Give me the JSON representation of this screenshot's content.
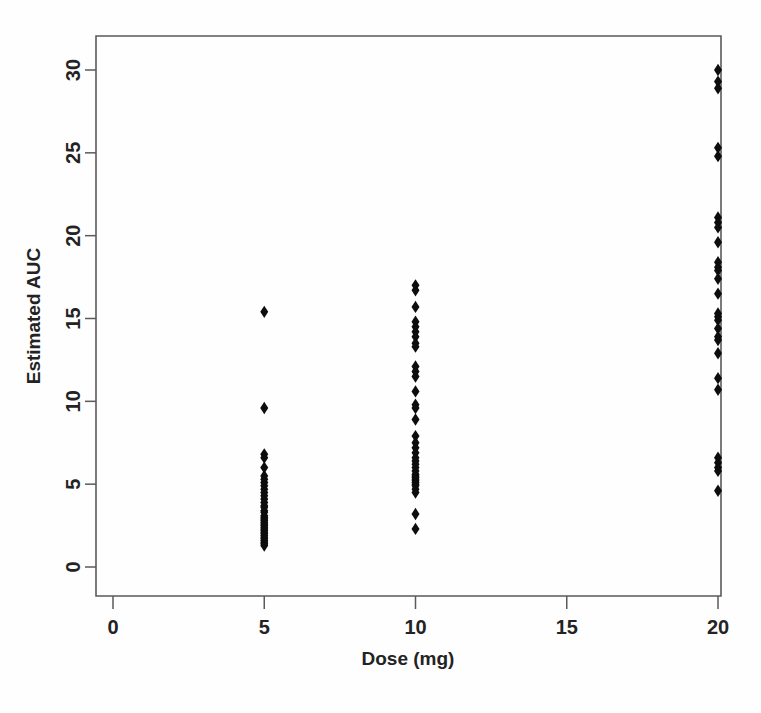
{
  "figure": {
    "title": "",
    "background_color": "#fefefe",
    "frame_color": "#5a5a5a",
    "point_color": "#0d0d0d"
  },
  "axes": {
    "x_title": "Dose (mg)",
    "y_title": "Estimated AUC",
    "x_ticks": [
      "0",
      "5",
      "10",
      "15",
      "20"
    ],
    "y_ticks": [
      "0",
      "5",
      "10",
      "15",
      "20",
      "25",
      "30"
    ]
  },
  "chart_data": {
    "type": "scatter",
    "title": "",
    "xlabel": "Dose (mg)",
    "ylabel": "Estimated AUC",
    "xlim": [
      -1.3,
      21.5
    ],
    "ylim": [
      -1.2,
      32.3
    ],
    "xticks": [
      0,
      5,
      10,
      15,
      20
    ],
    "yticks": [
      0,
      5,
      10,
      15,
      20,
      25,
      30
    ],
    "grid": false,
    "legend": false,
    "marker": "diamond",
    "marker_color": "#0d0d0d",
    "series": [
      {
        "name": "Dose 5 mg",
        "x": 5,
        "values": [
          15.4,
          9.6,
          6.8,
          6.6,
          6.0,
          5.5,
          5.3,
          5.1,
          4.9,
          4.7,
          4.5,
          4.3,
          4.1,
          3.9,
          3.7,
          3.6,
          3.4,
          3.3,
          3.1,
          3.0,
          2.9,
          2.8,
          2.7,
          2.6,
          2.5,
          2.4,
          2.3,
          2.2,
          2.1,
          2.0,
          1.9,
          1.8,
          1.7,
          1.6,
          1.5,
          1.4,
          1.3
        ]
      },
      {
        "name": "Dose 10 mg",
        "x": 10,
        "values": [
          17.0,
          16.7,
          15.7,
          14.8,
          14.5,
          14.2,
          13.9,
          13.5,
          13.3,
          12.1,
          11.8,
          11.5,
          10.6,
          9.8,
          9.6,
          8.9,
          7.9,
          7.5,
          7.2,
          6.9,
          6.6,
          6.4,
          6.2,
          6.0,
          5.8,
          5.6,
          5.5,
          5.4,
          5.3,
          5.2,
          5.1,
          5.0,
          4.9,
          4.7,
          4.5,
          3.2,
          2.3
        ]
      },
      {
        "name": "Dose 20 mg",
        "x": 20,
        "values": [
          30.0,
          29.3,
          28.9,
          25.3,
          24.8,
          21.1,
          20.8,
          20.5,
          19.6,
          18.4,
          18.1,
          17.9,
          17.4,
          16.5,
          15.3,
          15.1,
          14.9,
          14.4,
          13.9,
          13.7,
          12.9,
          11.4,
          10.7,
          6.6,
          6.3,
          6.0,
          5.8,
          4.6
        ]
      }
    ]
  }
}
